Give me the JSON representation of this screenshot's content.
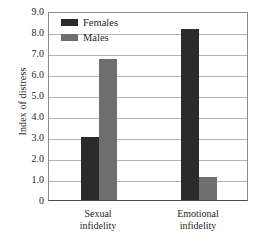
{
  "chart_data": {
    "type": "bar",
    "title": "",
    "xlabel": "",
    "ylabel": "Index of distress",
    "categories": [
      "Sexual infidelity",
      "Emotional infidelity"
    ],
    "category_lines": [
      [
        "Sexual",
        "infidelity"
      ],
      [
        "Emotional",
        "infidelity"
      ]
    ],
    "series": [
      {
        "name": "Females",
        "color": "#2b2b2b",
        "values": [
          3.0,
          8.15
        ]
      },
      {
        "name": "Males",
        "color": "#6f6f6f",
        "values": [
          6.7,
          1.1
        ]
      }
    ],
    "ylim": [
      0,
      9.0
    ],
    "ytick_step": 1.0,
    "ytick_labels": [
      "9.0",
      "8.0",
      "7.0",
      "6.0",
      "5.0",
      "4.0",
      "3.0",
      "2.0",
      "1.0",
      "0"
    ],
    "ytick_values": [
      9.0,
      8.0,
      7.0,
      6.0,
      5.0,
      4.0,
      3.0,
      2.0,
      1.0,
      0
    ],
    "grid": true,
    "legend_position": "top-left-inside"
  }
}
